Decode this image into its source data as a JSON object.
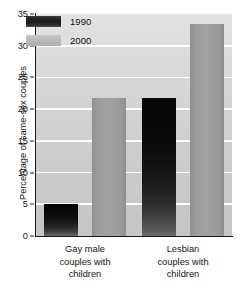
{
  "chart_data": {
    "type": "bar",
    "title": "",
    "xlabel": "",
    "ylabel": "Percentage of same-sex couples",
    "categories": [
      "Gay male couples with children",
      "Lesbian couples with children"
    ],
    "category_lines": [
      [
        "Gay male",
        "couples with",
        "children"
      ],
      [
        "Lesbian",
        "couples with",
        "children"
      ]
    ],
    "series": [
      {
        "name": "1990",
        "values": [
          5,
          21.7
        ],
        "color": "#1a1a1a"
      },
      {
        "name": "2000",
        "values": [
          21.7,
          33.5
        ],
        "color": "#9a9a9a"
      }
    ],
    "ylim": [
      0,
      35
    ],
    "yticks": [
      0,
      5,
      10,
      15,
      20,
      25,
      30,
      35
    ],
    "ytick_labels": [
      "0",
      "5",
      "10",
      "15",
      "20",
      "25",
      "30",
      "35"
    ],
    "grid": true,
    "grid_color": "#ffffff",
    "plot_background": "#d2d2d2",
    "legend": {
      "position": "upper-left-inside",
      "entries": [
        "1990",
        "2000"
      ]
    }
  }
}
